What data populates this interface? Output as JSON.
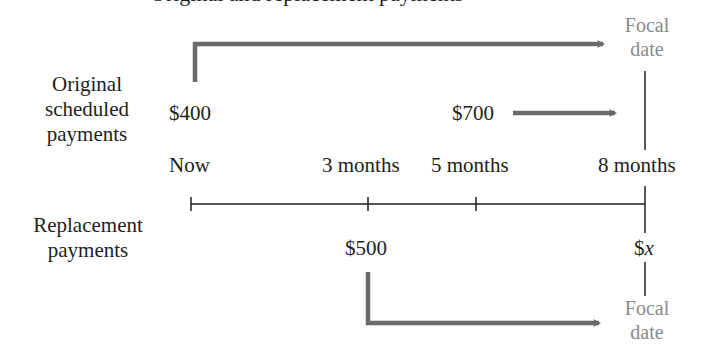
{
  "clipped_title": "Original and replacement payments",
  "row_labels": {
    "original": [
      "Original",
      "scheduled",
      "payments"
    ],
    "replacement": [
      "Replacement",
      "payments"
    ]
  },
  "timeline": {
    "points": [
      {
        "label": "Now",
        "months": 0
      },
      {
        "label": "3 months",
        "months": 3
      },
      {
        "label": "5 months",
        "months": 5
      },
      {
        "label": "8 months",
        "months": 8
      }
    ]
  },
  "original_payments": [
    {
      "amount": "$400",
      "when": "Now"
    },
    {
      "amount": "$700",
      "when": "5 months"
    }
  ],
  "replacement_payments": [
    {
      "amount": "$500",
      "when": "3 months"
    },
    {
      "amount_prefix": "$",
      "amount_var": "x",
      "when": "8 months"
    }
  ],
  "focal_date": {
    "top": [
      "Focal",
      "date"
    ],
    "bottom": [
      "Focal",
      "date"
    ],
    "at": "8 months"
  },
  "colors": {
    "arrow": "#6b6b6b",
    "line": "#1e1e1e",
    "focal_text": "#8a8a8a",
    "text": "#1e1e1e"
  }
}
